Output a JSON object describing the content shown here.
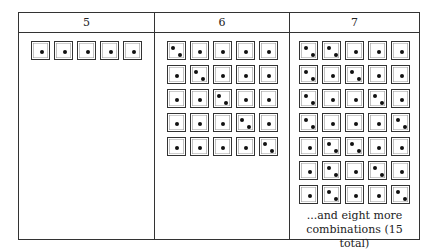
{
  "figure": {
    "columns": [
      {
        "header": "5",
        "rows": [
          [
            1,
            1,
            1,
            1,
            1
          ]
        ],
        "note": ""
      },
      {
        "header": "6",
        "rows": [
          [
            2,
            1,
            1,
            1,
            1
          ],
          [
            1,
            2,
            1,
            1,
            1
          ],
          [
            1,
            1,
            2,
            1,
            1
          ],
          [
            1,
            1,
            1,
            2,
            1
          ],
          [
            1,
            1,
            1,
            1,
            2
          ]
        ],
        "note": ""
      },
      {
        "header": "7",
        "rows": [
          [
            2,
            2,
            1,
            1,
            1
          ],
          [
            2,
            1,
            2,
            1,
            1
          ],
          [
            2,
            1,
            1,
            2,
            1
          ],
          [
            2,
            1,
            1,
            1,
            2
          ],
          [
            1,
            2,
            2,
            1,
            1
          ],
          [
            1,
            2,
            1,
            2,
            1
          ],
          [
            1,
            2,
            1,
            1,
            2
          ]
        ],
        "note_line1": "...and eight more",
        "note_line2": "combinations (15 total)"
      }
    ]
  },
  "colors": {
    "border": "#333333",
    "pip": "#111111",
    "background": "#ffffff"
  }
}
